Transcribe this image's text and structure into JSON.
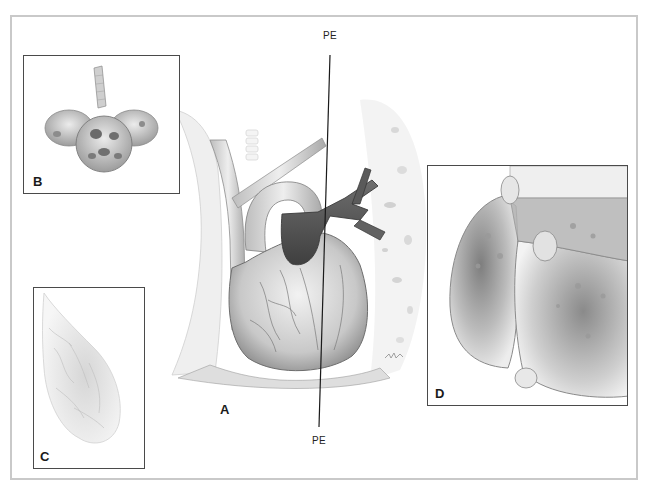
{
  "figure": {
    "panels": {
      "A": {
        "label": "A",
        "subject": "heart-and-great-vessels"
      },
      "B": {
        "label": "B",
        "subject": "alveolar-cluster-acinus"
      },
      "C": {
        "label": "C",
        "subject": "lung-lobule-pale"
      },
      "D": {
        "label": "D",
        "subject": "lung-tissue-cross-section"
      }
    },
    "callouts": {
      "top": "PE",
      "bottom": "PE"
    },
    "signature": "artist-signature"
  },
  "colors": {
    "frame": "#c9c9c9",
    "panel_border": "#4a4a4a",
    "ink": "#1a1a1a",
    "shade_dark": "#5a5a5a",
    "shade_mid": "#9a9a9a",
    "shade_light": "#d6d6d6"
  }
}
